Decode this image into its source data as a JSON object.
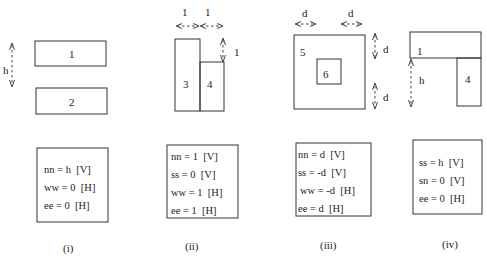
{
  "panels": [
    {
      "label": "(i)",
      "blocks": [
        "1",
        "2"
      ],
      "dimension_labels": [
        "h"
      ],
      "constraints": [
        "nn = h  [V]",
        "ww = 0  [H]",
        "ee = 0  [H]"
      ]
    },
    {
      "label": "(ii)",
      "blocks": [
        "3",
        "4"
      ],
      "dimension_labels": [
        "1",
        "1",
        "1"
      ],
      "constraints": [
        "nn = 1  [V]",
        "ss = 0  [V]",
        "ww = 1  [H]",
        "ee = 1  [H]"
      ]
    },
    {
      "label": "(iii)",
      "blocks": [
        "5",
        "6"
      ],
      "dimension_labels": [
        "d",
        "d",
        "d",
        "d"
      ],
      "constraints": [
        "nn = d  [V]",
        "ss = -d  [V]",
        "ww = -d  [H]",
        "ee = d  [H]"
      ]
    },
    {
      "label": "(iv)",
      "blocks": [
        "1",
        "4"
      ],
      "dimension_labels": [
        "h"
      ],
      "constraints": [
        "ss = h  [V]",
        "sn = 0  [V]",
        "ee = 0  [H]"
      ]
    }
  ]
}
